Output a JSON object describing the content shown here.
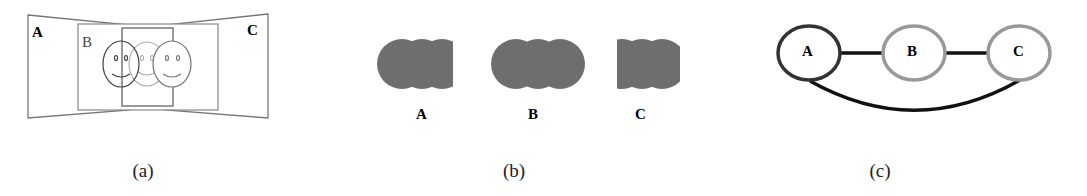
{
  "figure": {
    "panels": [
      {
        "id": "a",
        "caption": "(a)",
        "views": [
          {
            "label": "A"
          },
          {
            "label": "B"
          },
          {
            "label": "C"
          }
        ],
        "description": "Three overlapping camera views A, B, C each containing smiley faces"
      },
      {
        "id": "b",
        "caption": "(b)",
        "regions": [
          {
            "label": "A"
          },
          {
            "label": "B"
          },
          {
            "label": "C"
          }
        ],
        "description": "Gray blob regions for each view"
      },
      {
        "id": "c",
        "caption": "(c)",
        "nodes": [
          {
            "label": "A",
            "stroke": "#333333"
          },
          {
            "label": "B",
            "stroke": "#999999"
          },
          {
            "label": "C",
            "stroke": "#999999"
          }
        ],
        "edges": [
          [
            "A",
            "B"
          ],
          [
            "B",
            "C"
          ],
          [
            "A",
            "C"
          ]
        ],
        "description": "Graph of view adjacency"
      }
    ],
    "colors": {
      "blob_fill": "#6e6e6e",
      "edge": "#111111",
      "node_dark": "#333333",
      "node_light": "#999999",
      "line": "#777777"
    }
  }
}
